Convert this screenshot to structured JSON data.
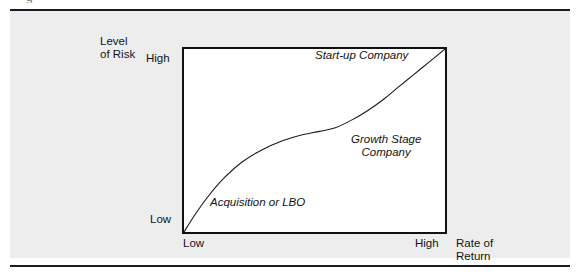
{
  "figure": {
    "caption_remnant": "g",
    "background_color": "#ededed",
    "rule_color": "#1c1c1c",
    "plot_background": "#ffffff",
    "plot_border_color": "#111111",
    "curve_color": "#1a1a1a"
  },
  "chart_data": {
    "type": "line",
    "title": "",
    "xlabel": "Rate of\nReturn",
    "ylabel": "Level\nof Risk",
    "x_ticks": [
      "Low",
      "High"
    ],
    "y_ticks": [
      "Low",
      "High"
    ],
    "xlim": [
      0,
      100
    ],
    "ylim": [
      0,
      100
    ],
    "grid": false,
    "legend": "none",
    "series": [
      {
        "name": "Risk vs. Return",
        "x": [
          0,
          4,
          9,
          15,
          22,
          30,
          38,
          45,
          52,
          58,
          64,
          70,
          76,
          82,
          88,
          94,
          100
        ],
        "y": [
          0,
          9,
          19,
          29,
          38,
          45,
          50,
          53,
          55,
          57,
          61,
          66,
          72,
          79,
          86,
          93,
          100
        ]
      }
    ],
    "annotations": [
      {
        "text": "Start-up Company",
        "x": 62,
        "y": 95,
        "style": "italic"
      },
      {
        "text": "Growth Stage\nCompany",
        "x": 76,
        "y": 52,
        "style": "italic"
      },
      {
        "text": "Acquisition or LBO",
        "x": 18,
        "y": 16,
        "style": "italic"
      }
    ]
  },
  "labels": {
    "y_axis_title": "Level\nof Risk",
    "x_axis_title": "Rate of\nReturn",
    "y_tick_high": "High",
    "y_tick_low": "Low",
    "x_tick_low": "Low",
    "x_tick_high": "High",
    "annotation_startup": "Start-up Company",
    "annotation_growth": "Growth Stage\nCompany",
    "annotation_acquisition": "Acquisition or LBO"
  }
}
